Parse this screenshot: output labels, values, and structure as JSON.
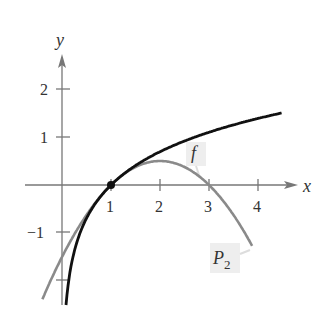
{
  "chart_data": {
    "type": "line",
    "title": "",
    "xlabel": "x",
    "ylabel": "y",
    "xlim": [
      -1,
      4.8
    ],
    "ylim": [
      -2.4,
      2.6
    ],
    "x_ticks": [
      "1",
      "2",
      "3",
      "4"
    ],
    "y_ticks": [
      "2",
      "1",
      "-1"
    ],
    "grid": false,
    "series": [
      {
        "name": "f",
        "description": "f(x) = ln x",
        "color": "#111111",
        "x": [
          0.1,
          0.25,
          0.5,
          1,
          1.5,
          2,
          2.5,
          3,
          3.5,
          4,
          4.5
        ],
        "values": [
          -2.3,
          -1.39,
          -0.69,
          0,
          0.41,
          0.69,
          0.92,
          1.1,
          1.25,
          1.39,
          1.5
        ]
      },
      {
        "name": "P_2",
        "description": "P2(x) = (x-1) - (x-1)^2/2",
        "color": "#888888",
        "x": [
          -0.4,
          0,
          0.5,
          1,
          1.5,
          2,
          2.5,
          3,
          3.5,
          3.9
        ],
        "values": [
          -2.38,
          -1.5,
          -0.625,
          0,
          0.375,
          0.5,
          0.375,
          0,
          -0.625,
          -1.305
        ]
      }
    ],
    "points": [
      {
        "x": 1,
        "y": 0,
        "label": "point of tangency"
      }
    ],
    "annotations": [
      {
        "text": "f",
        "near": "f curve at x≈2.6"
      },
      {
        "text": "P2",
        "near": "P_2 curve at x≈3.5"
      }
    ]
  },
  "labels": {
    "x_axis": "x",
    "y_axis": "y",
    "x_tick_1": "1",
    "x_tick_2": "2",
    "x_tick_3": "3",
    "x_tick_4": "4",
    "y_tick_2": "2",
    "y_tick_1": "1",
    "y_tick_neg1": "−1",
    "f_label": "f",
    "p2_label_main": "P",
    "p2_label_sub": "2"
  }
}
